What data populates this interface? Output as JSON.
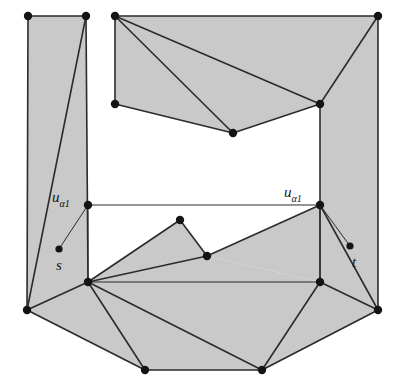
{
  "figure": {
    "type": "planar-graph-diagram",
    "width": 400,
    "height": 390,
    "background_color": "#ffffff",
    "fill_color": "#c9c9c9",
    "stroke_color": "#2b2b2b",
    "vertex_color": "#141414",
    "stroke_width": 1.6,
    "thin_stroke_width": 1.0,
    "vertex_radius": 4.2,
    "small_vertex_radius": 3.6,
    "labels": {
      "u_left": {
        "base": "u",
        "sub": "α1",
        "x": 52,
        "y": 199
      },
      "u_right": {
        "base": "u",
        "sub": "α1",
        "x": 284,
        "y": 194
      },
      "s": {
        "base": "s",
        "x": 56,
        "y": 267
      },
      "t": {
        "base": "t",
        "x": 352,
        "y": 264
      }
    },
    "vertices": [
      {
        "name": "tl-outer",
        "x": 28,
        "y": 16,
        "r": 4.2
      },
      {
        "name": "tl-inner",
        "x": 86,
        "y": 16,
        "r": 4.2
      },
      {
        "name": "tm-left",
        "x": 115,
        "y": 16,
        "r": 4.2
      },
      {
        "name": "tr-outer",
        "x": 378,
        "y": 16,
        "r": 4.2
      },
      {
        "name": "tm-left-low",
        "x": 115,
        "y": 104,
        "r": 4.2
      },
      {
        "name": "upper-mid-low",
        "x": 233,
        "y": 133,
        "r": 4.2
      },
      {
        "name": "right-hub-top",
        "x": 320,
        "y": 104,
        "r": 4.2
      },
      {
        "name": "u-left-node",
        "x": 88,
        "y": 205,
        "r": 4.2
      },
      {
        "name": "u-right-node",
        "x": 320,
        "y": 205,
        "r": 4.2
      },
      {
        "name": "mid-peak",
        "x": 180,
        "y": 220,
        "r": 4.2
      },
      {
        "name": "mid-right",
        "x": 207,
        "y": 256,
        "r": 4.2
      },
      {
        "name": "s-node",
        "x": 59,
        "y": 249,
        "r": 3.6
      },
      {
        "name": "t-node",
        "x": 350,
        "y": 246,
        "r": 3.6
      },
      {
        "name": "left-hub",
        "x": 88,
        "y": 282,
        "r": 4.2
      },
      {
        "name": "right-hub",
        "x": 320,
        "y": 282,
        "r": 4.2
      },
      {
        "name": "bl-outer",
        "x": 27,
        "y": 310,
        "r": 4.2
      },
      {
        "name": "br-outer",
        "x": 378,
        "y": 310,
        "r": 4.2
      },
      {
        "name": "bottom-left",
        "x": 145,
        "y": 370,
        "r": 4.2
      },
      {
        "name": "bottom-right",
        "x": 262,
        "y": 370,
        "r": 4.2
      }
    ],
    "faces": [
      {
        "name": "left-column-face",
        "points": "28,16 86,16 88,282 27,310"
      },
      {
        "name": "upper-mid-face",
        "points": "115,16 378,16 320,104 233,133 115,104"
      },
      {
        "name": "right-upper-face",
        "points": "320,104 378,16 378,310 320,282 320,205"
      },
      {
        "name": "mid-peak-face",
        "points": "88,282 180,220 207,256"
      },
      {
        "name": "mid-band-face",
        "points": "88,282 207,256 320,282 320,282"
      },
      {
        "name": "mid-right-face",
        "points": "207,256 320,205 320,282"
      },
      {
        "name": "bottom-fan-face",
        "points": "27,310 88,282 145,370"
      },
      {
        "name": "bottom-core-face",
        "points": "88,282 320,282 262,370 145,370"
      },
      {
        "name": "bottom-right-face",
        "points": "320,282 378,310 262,370"
      }
    ],
    "edges": [
      {
        "name": "left-col-top",
        "d": "M28,16 L86,16",
        "w": 1.6
      },
      {
        "name": "left-col-left",
        "d": "M28,16 L27,310",
        "w": 1.6
      },
      {
        "name": "left-col-right",
        "d": "M86,16 L88,282",
        "w": 1.6
      },
      {
        "name": "left-col-diagonal",
        "d": "M86,16 L27,310",
        "w": 1.6
      },
      {
        "name": "upper-top",
        "d": "M115,16 L378,16",
        "w": 1.6
      },
      {
        "name": "upper-left",
        "d": "M115,16 L115,104",
        "w": 1.6
      },
      {
        "name": "upper-fan-a",
        "d": "M115,16 L233,133",
        "w": 1.6
      },
      {
        "name": "upper-fan-b",
        "d": "M115,16 L320,104",
        "w": 1.6
      },
      {
        "name": "upper-bottom-left",
        "d": "M115,104 L233,133",
        "w": 1.6
      },
      {
        "name": "upper-bottom-right",
        "d": "M233,133 L320,104",
        "w": 1.6
      },
      {
        "name": "right-top-edge",
        "d": "M320,104 L378,16",
        "w": 1.6
      },
      {
        "name": "right-outer",
        "d": "M378,16 L378,310",
        "w": 1.6
      },
      {
        "name": "right-col-vertical",
        "d": "M320,104 L320,282",
        "w": 1.6
      },
      {
        "name": "band-top",
        "d": "M88,205 L320,205",
        "w": 1.0
      },
      {
        "name": "u-left-stem",
        "d": "M88,205 L88,282",
        "w": 1.0
      },
      {
        "name": "s-connector",
        "d": "M88,205 L59,249",
        "w": 1.0
      },
      {
        "name": "t-connector",
        "d": "M320,205 L350,246",
        "w": 1.0
      },
      {
        "name": "peak-left",
        "d": "M88,282 L180,220",
        "w": 1.6
      },
      {
        "name": "peak-right",
        "d": "M180,220 L207,256",
        "w": 1.6
      },
      {
        "name": "hub-to-midright",
        "d": "M88,282 L207,256",
        "w": 1.6
      },
      {
        "name": "midright-to-uright",
        "d": "M207,256 L320,205",
        "w": 1.6
      },
      {
        "name": "band-bottom",
        "d": "M88,282 L320,282",
        "w": 1.0
      },
      {
        "name": "hub-to-bl",
        "d": "M88,282 L27,310",
        "w": 1.6
      },
      {
        "name": "hub-to-bottomleft",
        "d": "M88,282 L145,370",
        "w": 1.6
      },
      {
        "name": "hub-to-bottomright",
        "d": "M88,282 L262,370",
        "w": 1.6
      },
      {
        "name": "bl-to-bottomleft",
        "d": "M27,310 L145,370",
        "w": 1.6
      },
      {
        "name": "bottom-base",
        "d": "M145,370 L262,370",
        "w": 1.6
      },
      {
        "name": "bottomright-to-hub",
        "d": "M262,370 L320,282",
        "w": 1.6
      },
      {
        "name": "bottomright-to-br",
        "d": "M262,370 L378,310",
        "w": 1.6
      },
      {
        "name": "br-to-hub",
        "d": "M378,310 L320,282",
        "w": 1.6
      },
      {
        "name": "right-hub-to-uright",
        "d": "M320,282 L320,205",
        "w": 1.0
      },
      {
        "name": "uright-to-br",
        "d": "M320,205 L378,310",
        "w": 1.6
      }
    ]
  }
}
